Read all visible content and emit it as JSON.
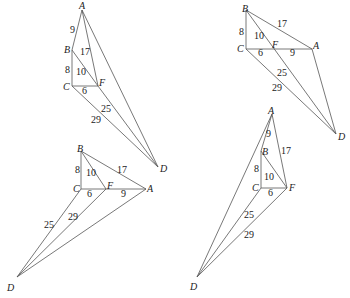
{
  "figures": [
    {
      "id": "top-left",
      "points": {
        "A": {
          "x": 82,
          "y": 10,
          "lx": 79,
          "ly": 9
        },
        "B": {
          "x": 72,
          "y": 50,
          "lx": 64,
          "ly": 53
        },
        "C": {
          "x": 72,
          "y": 86,
          "lx": 63,
          "ly": 90
        },
        "F": {
          "x": 98,
          "y": 86,
          "lx": 99,
          "ly": 86
        },
        "D": {
          "x": 158,
          "y": 167,
          "lx": 160,
          "ly": 172
        }
      },
      "segments": [
        [
          "A",
          "B"
        ],
        [
          "B",
          "C"
        ],
        [
          "C",
          "F"
        ],
        [
          "B",
          "F"
        ],
        [
          "A",
          "F"
        ],
        [
          "A",
          "D"
        ],
        [
          "F",
          "D"
        ],
        [
          "C",
          "D"
        ]
      ],
      "lengths": [
        {
          "text": "9",
          "x": 70,
          "y": 33
        },
        {
          "text": "17",
          "x": 80,
          "y": 55
        },
        {
          "text": "8",
          "x": 65,
          "y": 73
        },
        {
          "text": "10",
          "x": 76,
          "y": 75
        },
        {
          "text": "6",
          "x": 82,
          "y": 94
        },
        {
          "text": "25",
          "x": 101,
          "y": 112
        },
        {
          "text": "29",
          "x": 91,
          "y": 123
        }
      ]
    },
    {
      "id": "top-right",
      "points": {
        "B": {
          "x": 246,
          "y": 10,
          "lx": 242,
          "ly": 12
        },
        "C": {
          "x": 246,
          "y": 49,
          "lx": 237,
          "ly": 52
        },
        "F": {
          "x": 272,
          "y": 49,
          "lx": 272,
          "ly": 48
        },
        "A": {
          "x": 312,
          "y": 49,
          "lx": 313,
          "ly": 49
        },
        "D": {
          "x": 336,
          "y": 134,
          "lx": 338,
          "ly": 140
        }
      },
      "segments": [
        [
          "B",
          "C"
        ],
        [
          "C",
          "A"
        ],
        [
          "B",
          "A"
        ],
        [
          "B",
          "D"
        ],
        [
          "C",
          "D"
        ],
        [
          "A",
          "D"
        ]
      ],
      "lengths": [
        {
          "text": "17",
          "x": 277,
          "y": 27
        },
        {
          "text": "8",
          "x": 239,
          "y": 35
        },
        {
          "text": "10",
          "x": 254,
          "y": 39
        },
        {
          "text": "6",
          "x": 258,
          "y": 56
        },
        {
          "text": "9",
          "x": 290,
          "y": 56
        },
        {
          "text": "25",
          "x": 277,
          "y": 76
        },
        {
          "text": "29",
          "x": 272,
          "y": 91
        }
      ]
    },
    {
      "id": "bottom-left",
      "points": {
        "B": {
          "x": 81,
          "y": 151,
          "lx": 77,
          "ly": 152
        },
        "C": {
          "x": 81,
          "y": 189,
          "lx": 73,
          "ly": 192
        },
        "F": {
          "x": 106,
          "y": 189,
          "lx": 107,
          "ly": 189
        },
        "A": {
          "x": 146,
          "y": 189,
          "lx": 147,
          "ly": 192
        },
        "D": {
          "x": 17,
          "y": 277,
          "lx": 7,
          "ly": 291
        }
      },
      "segments": [
        [
          "B",
          "C"
        ],
        [
          "C",
          "A"
        ],
        [
          "B",
          "A"
        ],
        [
          "B",
          "F"
        ],
        [
          "C",
          "D"
        ],
        [
          "F",
          "D"
        ],
        [
          "A",
          "D"
        ]
      ],
      "lengths": [
        {
          "text": "8",
          "x": 75,
          "y": 173
        },
        {
          "text": "17",
          "x": 117,
          "y": 173
        },
        {
          "text": "10",
          "x": 86,
          "y": 176
        },
        {
          "text": "6",
          "x": 87,
          "y": 197
        },
        {
          "text": "9",
          "x": 121,
          "y": 197
        },
        {
          "text": "29",
          "x": 68,
          "y": 220
        },
        {
          "text": "25",
          "x": 44,
          "y": 228
        }
      ]
    },
    {
      "id": "bottom-right",
      "points": {
        "A": {
          "x": 272,
          "y": 114,
          "lx": 268,
          "ly": 114
        },
        "B": {
          "x": 261,
          "y": 151,
          "lx": 262,
          "ly": 155
        },
        "C": {
          "x": 261,
          "y": 188,
          "lx": 252,
          "ly": 191
        },
        "F": {
          "x": 287,
          "y": 188,
          "lx": 289,
          "ly": 191
        },
        "D": {
          "x": 197,
          "y": 277,
          "lx": 190,
          "ly": 290
        }
      },
      "segments": [
        [
          "A",
          "B"
        ],
        [
          "B",
          "C"
        ],
        [
          "C",
          "F"
        ],
        [
          "B",
          "F"
        ],
        [
          "A",
          "F"
        ],
        [
          "A",
          "D"
        ],
        [
          "C",
          "D"
        ],
        [
          "F",
          "D"
        ]
      ],
      "lengths": [
        {
          "text": "9",
          "x": 266,
          "y": 137
        },
        {
          "text": "17",
          "x": 281,
          "y": 154
        },
        {
          "text": "8",
          "x": 254,
          "y": 172
        },
        {
          "text": "10",
          "x": 264,
          "y": 180
        },
        {
          "text": "6",
          "x": 268,
          "y": 196
        },
        {
          "text": "25",
          "x": 244,
          "y": 218
        },
        {
          "text": "29",
          "x": 244,
          "y": 238
        }
      ]
    }
  ]
}
